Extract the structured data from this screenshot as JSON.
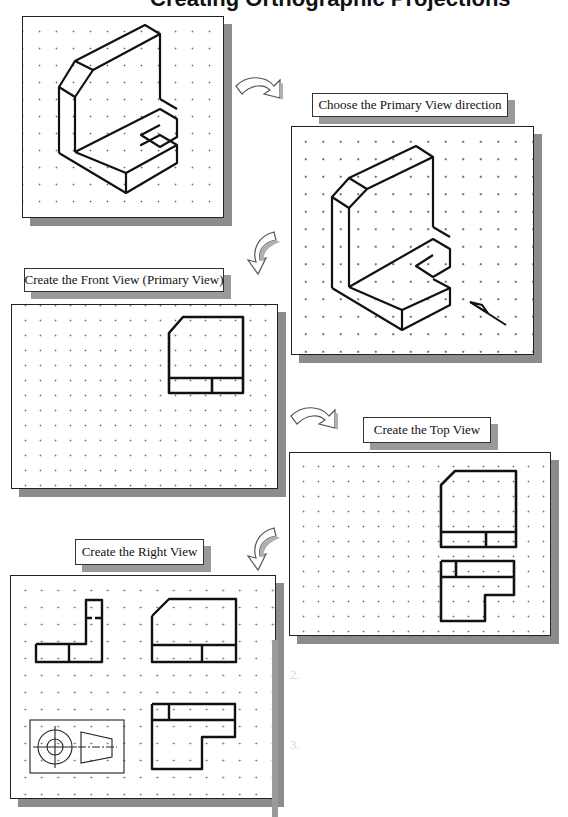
{
  "page": {
    "title_partial": "Creating Orthographic Projections",
    "background_color": "#ffffff",
    "shadow_color": "#8c8c8c"
  },
  "steps": [
    {
      "id": "isometric",
      "label": ""
    },
    {
      "id": "primary-direction",
      "label": "Choose the Primary View direction"
    },
    {
      "id": "front-view",
      "label": "Create the Front View (Primary View)"
    },
    {
      "id": "top-view",
      "label": "Create the Top View"
    },
    {
      "id": "right-view",
      "label": "Create the Right View"
    }
  ],
  "arrows": [
    {
      "from": "isometric",
      "to": "primary-direction",
      "direction": "curved-right-down"
    },
    {
      "from": "primary-direction",
      "to": "front-view",
      "direction": "curved-left-down"
    },
    {
      "from": "front-view",
      "to": "top-view",
      "direction": "curved-right-down"
    },
    {
      "from": "top-view",
      "to": "right-view",
      "direction": "curved-left-down"
    }
  ],
  "views_drawn": {
    "front_view": "L-bracket front with chamfered top-left corner and horizontal base split",
    "top_view": "L-shaped notch outline",
    "right_view": "L profile with hidden line",
    "projection_symbol": "third-angle projection symbol (circles + truncated cone)"
  },
  "ghost_text": {
    "item_2_number": "2.",
    "item_3_number": "3."
  }
}
